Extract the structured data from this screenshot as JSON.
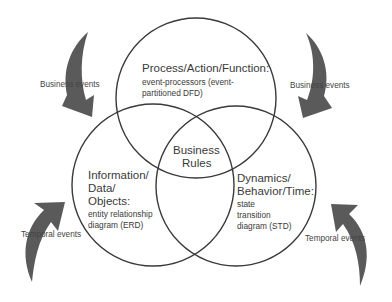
{
  "diagram": {
    "circles": {
      "top": {
        "title": "Process/Action/Function:",
        "subtitle_line1": "event-processors (event-",
        "subtitle_line2": "partitioned DFD)"
      },
      "left": {
        "title_line1": "Information/",
        "title_line2": "Data/",
        "title_line3": "Objects:",
        "subtitle_line1": "entity relationship",
        "subtitle_line2": "diagram (ERD)"
      },
      "right": {
        "title_line1": "Dynamics/",
        "title_line2": "Behavior/Time:",
        "subtitle_line1": "state",
        "subtitle_line2": "transition",
        "subtitle_line3": "diagram (STD)"
      },
      "center": {
        "line1": "Business",
        "line2": "Rules"
      }
    },
    "arrows": {
      "top_left": "Business events",
      "top_right": "Business events",
      "bottom_left": "Temporal events",
      "bottom_right": "Temporal events"
    },
    "colors": {
      "stroke": "#3a3a3a",
      "arrow_fill": "#5a5a5a"
    }
  }
}
